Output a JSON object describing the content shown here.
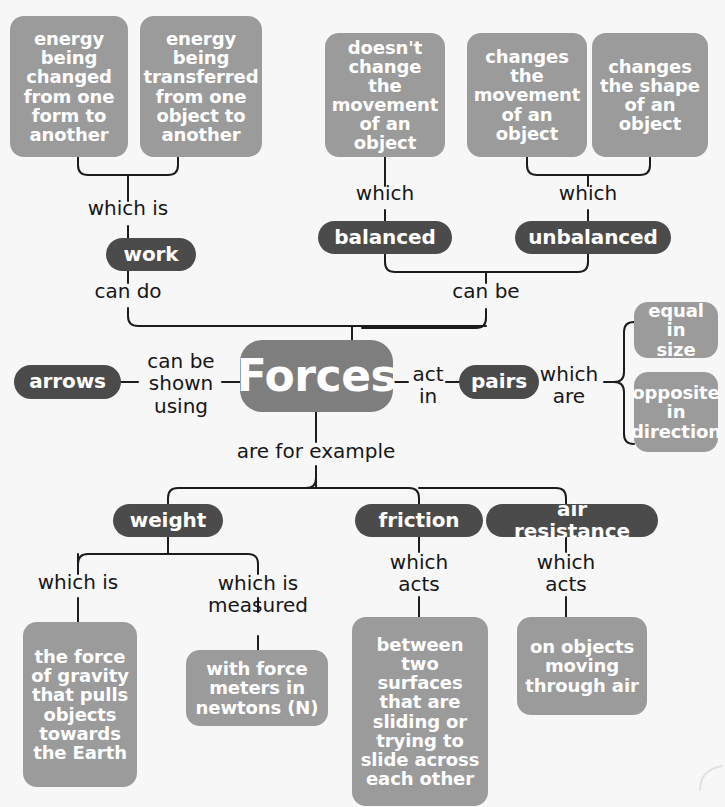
{
  "diagram": {
    "title": "Forces",
    "root": {
      "label": "Forces"
    },
    "colors": {
      "background": "#f7f7f7",
      "box_fill": "#9b9b9b",
      "pill_fill": "#4b4b4b",
      "root_fill": "#7e7e7e",
      "connector": "#1c1c1c",
      "node_text": "#ffffff",
      "label_text": "#161616"
    },
    "nodes": [
      {
        "id": "energy-changed",
        "label": "energy\nbeing\nchanged\nfrom one\nform to\nanother"
      },
      {
        "id": "energy-transferred",
        "label": "energy\nbeing\ntransferred\nfrom one\nobject to\nanother"
      },
      {
        "id": "no-change-movement",
        "label": "doesn't\nchange the\nmovement\nof an object"
      },
      {
        "id": "changes-movement",
        "label": "changes\nthe\nmovement\nof an object"
      },
      {
        "id": "changes-shape",
        "label": "changes\nthe shape\nof an\nobject"
      },
      {
        "id": "work",
        "label": "work"
      },
      {
        "id": "balanced",
        "label": "balanced"
      },
      {
        "id": "unbalanced",
        "label": "unbalanced"
      },
      {
        "id": "arrows",
        "label": "arrows"
      },
      {
        "id": "pairs",
        "label": "pairs"
      },
      {
        "id": "equal-in-size",
        "label": "equal in\nsize"
      },
      {
        "id": "opposite-direction",
        "label": "opposite\nin\ndirection"
      },
      {
        "id": "weight",
        "label": "weight"
      },
      {
        "id": "friction",
        "label": "friction"
      },
      {
        "id": "air-resistance",
        "label": "air resistance"
      },
      {
        "id": "force-of-gravity",
        "label": "the force\nof gravity\nthat pulls\nobjects\ntowards\nthe Earth"
      },
      {
        "id": "force-meters",
        "label": "with force\nmeters in\nnewtons (N)"
      },
      {
        "id": "between-surfaces",
        "label": "between\ntwo surfaces\nthat are\nsliding or\ntrying to\nslide across\neach other"
      },
      {
        "id": "on-objects-air",
        "label": "on objects\nmoving\nthrough air"
      }
    ],
    "link_labels": [
      {
        "id": "which-is-work",
        "text": "which is"
      },
      {
        "id": "can-do",
        "text": "can do"
      },
      {
        "id": "which-balanced",
        "text": "which"
      },
      {
        "id": "which-unbalanced",
        "text": "which"
      },
      {
        "id": "can-be",
        "text": "can be"
      },
      {
        "id": "can-be-shown-using",
        "text": "can be\nshown\nusing"
      },
      {
        "id": "act-in",
        "text": "act\nin"
      },
      {
        "id": "which-are",
        "text": "which\nare"
      },
      {
        "id": "are-for-example",
        "text": "are for example"
      },
      {
        "id": "which-is-gravity",
        "text": "which is"
      },
      {
        "id": "which-is-measured",
        "text": "which is\nmeasured"
      },
      {
        "id": "which-acts-friction",
        "text": "which\nacts"
      },
      {
        "id": "which-acts-air",
        "text": "which\nacts"
      }
    ]
  }
}
